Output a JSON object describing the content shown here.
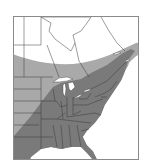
{
  "map": {
    "region": "Eastern North America",
    "legend": {
      "core_range": {
        "label": "Core range",
        "color": "#7a7a7a"
      },
      "peripheral_range": {
        "label": "Peripheral range",
        "color": "#a9a9a9"
      },
      "outside_range": {
        "label": "Outside range",
        "color": "#ffffff"
      }
    },
    "colors": {
      "frame": "#8a8a8a",
      "border_lines": "#3a3a3a",
      "water": "#ffffff"
    }
  }
}
